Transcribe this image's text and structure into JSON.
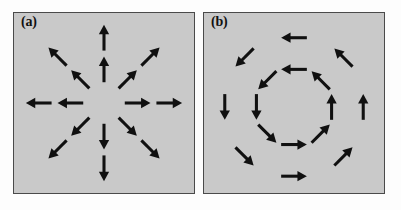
{
  "figure": {
    "background_color": "#fdfdfd",
    "panel_background_color": "#c9c9c9",
    "panel_border_color": "#4a4a4a",
    "arrow_color": "#101010",
    "panels": [
      {
        "id": "a",
        "label": "(a)",
        "pattern_type": "radial-source",
        "description": "Arrows point radially outward from the centre (source / node).",
        "ring_count": 2,
        "directions": 8,
        "arrow_count": 16,
        "center": [
          91,
          91
        ],
        "ring_radii": [
          34,
          66
        ],
        "arrow_length": 26,
        "direction_angles_deg": [
          0,
          45,
          90,
          135,
          180,
          225,
          270,
          315
        ],
        "arrows": [
          {
            "cx": 91,
            "cy": 57,
            "angle_deg": 270,
            "ring": 1,
            "points": "up"
          },
          {
            "cx": 91,
            "cy": 25,
            "angle_deg": 270,
            "ring": 2,
            "points": "up"
          },
          {
            "cx": 115,
            "cy": 67,
            "angle_deg": 315,
            "ring": 1,
            "points": "up-right"
          },
          {
            "cx": 138,
            "cy": 44,
            "angle_deg": 315,
            "ring": 2,
            "points": "up-right"
          },
          {
            "cx": 125,
            "cy": 91,
            "angle_deg": 0,
            "ring": 1,
            "points": "right"
          },
          {
            "cx": 157,
            "cy": 91,
            "angle_deg": 0,
            "ring": 2,
            "points": "right"
          },
          {
            "cx": 115,
            "cy": 115,
            "angle_deg": 45,
            "ring": 1,
            "points": "down-right"
          },
          {
            "cx": 138,
            "cy": 138,
            "angle_deg": 45,
            "ring": 2,
            "points": "down-right"
          },
          {
            "cx": 91,
            "cy": 125,
            "angle_deg": 90,
            "ring": 1,
            "points": "down"
          },
          {
            "cx": 91,
            "cy": 157,
            "angle_deg": 90,
            "ring": 2,
            "points": "down"
          },
          {
            "cx": 67,
            "cy": 115,
            "angle_deg": 135,
            "ring": 1,
            "points": "down-left"
          },
          {
            "cx": 44,
            "cy": 138,
            "angle_deg": 135,
            "ring": 2,
            "points": "down-left"
          },
          {
            "cx": 57,
            "cy": 91,
            "angle_deg": 180,
            "ring": 1,
            "points": "left"
          },
          {
            "cx": 25,
            "cy": 91,
            "angle_deg": 180,
            "ring": 2,
            "points": "left"
          },
          {
            "cx": 67,
            "cy": 67,
            "angle_deg": 225,
            "ring": 1,
            "points": "up-left"
          },
          {
            "cx": 44,
            "cy": 44,
            "angle_deg": 225,
            "ring": 2,
            "points": "up-left"
          }
        ]
      },
      {
        "id": "b",
        "label": "(b)",
        "pattern_type": "circular-vortex",
        "description": "Arrows run tangentially around the centre forming two concentric rings (vortex / centre).",
        "ring_count": 2,
        "directions": 8,
        "arrow_count": 16,
        "center": [
          91,
          95
        ],
        "ring_radii": [
          38,
          70
        ],
        "arrow_length": 26,
        "circulation": "counterclockwise",
        "arrows": [
          {
            "cx": 91,
            "cy": 57,
            "angle_deg": 180,
            "ring": 1,
            "points": "left"
          },
          {
            "cx": 91,
            "cy": 25,
            "angle_deg": 180,
            "ring": 2,
            "points": "left"
          },
          {
            "cx": 64,
            "cy": 68,
            "angle_deg": 135,
            "ring": 1,
            "points": "down-left"
          },
          {
            "cx": 41,
            "cy": 45,
            "angle_deg": 135,
            "ring": 2,
            "points": "down-left"
          },
          {
            "cx": 53,
            "cy": 95,
            "angle_deg": 90,
            "ring": 1,
            "points": "down"
          },
          {
            "cx": 21,
            "cy": 95,
            "angle_deg": 90,
            "ring": 2,
            "points": "down"
          },
          {
            "cx": 64,
            "cy": 122,
            "angle_deg": 45,
            "ring": 1,
            "points": "down-right"
          },
          {
            "cx": 41,
            "cy": 145,
            "angle_deg": 45,
            "ring": 2,
            "points": "down-right"
          },
          {
            "cx": 91,
            "cy": 133,
            "angle_deg": 0,
            "ring": 1,
            "points": "right"
          },
          {
            "cx": 91,
            "cy": 165,
            "angle_deg": 0,
            "ring": 2,
            "points": "right"
          },
          {
            "cx": 118,
            "cy": 122,
            "angle_deg": 315,
            "ring": 1,
            "points": "up-right"
          },
          {
            "cx": 141,
            "cy": 145,
            "angle_deg": 315,
            "ring": 2,
            "points": "up-right"
          },
          {
            "cx": 129,
            "cy": 95,
            "angle_deg": 270,
            "ring": 1,
            "points": "up"
          },
          {
            "cx": 161,
            "cy": 95,
            "angle_deg": 270,
            "ring": 2,
            "points": "up"
          },
          {
            "cx": 118,
            "cy": 68,
            "angle_deg": 225,
            "ring": 1,
            "points": "up-left"
          },
          {
            "cx": 141,
            "cy": 45,
            "angle_deg": 225,
            "ring": 2,
            "points": "up-left"
          }
        ]
      }
    ]
  }
}
